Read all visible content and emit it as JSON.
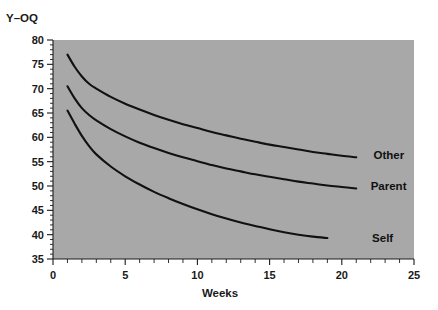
{
  "chart_data": {
    "type": "line",
    "title": "",
    "xlabel": "Weeks",
    "ylabel": "Y–OQ",
    "xlim": [
      0,
      25
    ],
    "ylim": [
      35,
      80
    ],
    "x_ticks": [
      0,
      5,
      10,
      15,
      20,
      25
    ],
    "y_ticks": [
      35,
      40,
      45,
      50,
      55,
      60,
      65,
      70,
      75,
      80
    ],
    "x_tick_labels": [
      "0",
      "5",
      "10",
      "15",
      "20",
      "25"
    ],
    "y_tick_labels": [
      "35",
      "40",
      "45",
      "50",
      "55",
      "60",
      "65",
      "70",
      "75",
      "80"
    ],
    "x_minor_tick_step": 1,
    "y_minor_tick_step": 1,
    "grid": false,
    "legend_position": "inline-end-of-line",
    "plot_background_color": "#a8a8a8",
    "line_color": "#111111",
    "series": [
      {
        "name": "Other",
        "label": "Other",
        "label_x": 22.2,
        "label_y": 56.3,
        "x": [
          1,
          1.5,
          2,
          2.5,
          3,
          4,
          5,
          6,
          7,
          8,
          9,
          10,
          11,
          12,
          13,
          14,
          15,
          16,
          17,
          18,
          19,
          20,
          21
        ],
        "values": [
          77.0,
          74.5,
          72.5,
          71.0,
          70.0,
          68.3,
          66.9,
          65.7,
          64.6,
          63.6,
          62.7,
          61.9,
          61.1,
          60.4,
          59.7,
          59.1,
          58.5,
          58.0,
          57.5,
          57.0,
          56.6,
          56.2,
          55.9
        ]
      },
      {
        "name": "Parent",
        "label": "Parent",
        "label_x": 22.0,
        "label_y": 49.9,
        "x": [
          1,
          1.5,
          2,
          2.5,
          3,
          4,
          5,
          6,
          7,
          8,
          9,
          10,
          11,
          12,
          13,
          14,
          15,
          16,
          17,
          18,
          19,
          20,
          21
        ],
        "values": [
          70.5,
          68.0,
          66.0,
          64.6,
          63.5,
          61.7,
          60.2,
          58.9,
          57.8,
          56.8,
          55.9,
          55.1,
          54.3,
          53.6,
          53.0,
          52.4,
          51.9,
          51.4,
          50.9,
          50.5,
          50.1,
          49.8,
          49.5
        ]
      },
      {
        "name": "Self",
        "label": "Self",
        "label_x": 22.1,
        "label_y": 39.4,
        "x": [
          1,
          1.5,
          2,
          2.5,
          3,
          4,
          5,
          6,
          7,
          8,
          9,
          10,
          11,
          12,
          13,
          14,
          15,
          16,
          17,
          18,
          19
        ],
        "values": [
          65.5,
          62.8,
          60.3,
          58.2,
          56.5,
          54.0,
          52.0,
          50.3,
          48.8,
          47.5,
          46.3,
          45.2,
          44.2,
          43.3,
          42.5,
          41.8,
          41.1,
          40.5,
          40.0,
          39.6,
          39.3
        ]
      }
    ]
  }
}
